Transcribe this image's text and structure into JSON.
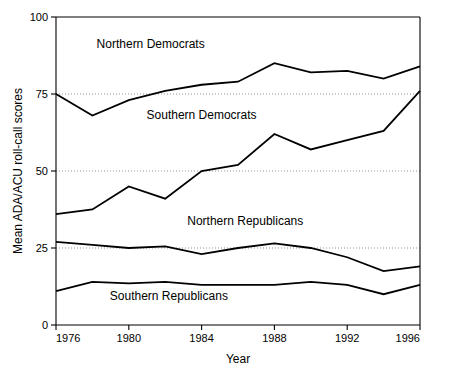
{
  "chart_data": {
    "type": "line",
    "title": "",
    "xlabel": "Year",
    "ylabel": "Mean ADA/ACU roll-call scores",
    "xlim": [
      1976,
      1996
    ],
    "ylim": [
      0,
      100
    ],
    "xticks": [
      1976,
      1980,
      1984,
      1988,
      1992,
      1996
    ],
    "yticks": [
      0,
      25,
      50,
      75,
      100
    ],
    "xtick_labels": [
      "1976",
      "1980",
      "1984",
      "1988",
      "1992",
      "1996"
    ],
    "ytick_labels": [
      "0",
      "25",
      "50",
      "75",
      "100"
    ],
    "grid": "horizontal dotted gridlines at 25, 50, 75",
    "legend_position": "inline labels above each series",
    "x": [
      1976,
      1978,
      1980,
      1982,
      1984,
      1986,
      1988,
      1990,
      1992,
      1994,
      1996
    ],
    "series": [
      {
        "name": "Northern Democrats",
        "label_text": "Northern Democrats",
        "values": [
          75,
          68,
          73,
          76,
          78,
          79,
          85,
          82,
          82.5,
          80,
          84
        ]
      },
      {
        "name": "Southern Democrats",
        "label_text": "Southern Democrats",
        "values": [
          36,
          37.5,
          45,
          41,
          50,
          52,
          62,
          57,
          60,
          63,
          76
        ]
      },
      {
        "name": "Northern Republicans",
        "label_text": "Northern Republicans",
        "values": [
          27,
          26,
          25,
          25.5,
          23,
          25,
          26.5,
          25,
          22,
          17.5,
          19
        ]
      },
      {
        "name": "Southern Republicans",
        "label_text": "Southern Republicans",
        "values": [
          11,
          14,
          13.5,
          14,
          13,
          13,
          13,
          14,
          13,
          10,
          13
        ]
      }
    ],
    "annotations": [
      {
        "text": "Northern Democrats",
        "x": 1981.2,
        "y": 90
      },
      {
        "text": "Southern Democrats",
        "x": 1984.0,
        "y": 67
      },
      {
        "text": "Northern Republicans",
        "x": 1986.4,
        "y": 32.5
      },
      {
        "text": "Southern Republicans",
        "x": 1982.2,
        "y": 8.2
      }
    ],
    "colors": {
      "line": "#000000",
      "axis": "#000000",
      "grid": "#777777",
      "background": "#ffffff"
    }
  }
}
